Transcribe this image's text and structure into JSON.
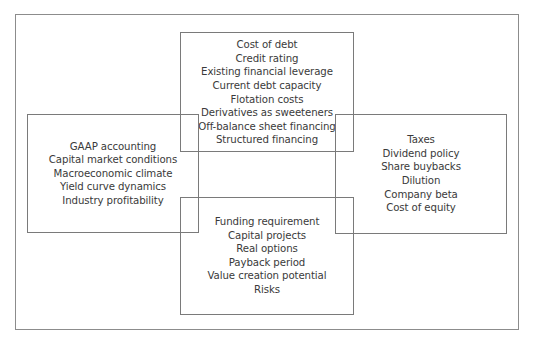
{
  "diagram": {
    "type": "overlapping-boxes",
    "boxes": {
      "top": {
        "items": [
          "Cost of debt",
          "Credit rating",
          "Existing financial leverage",
          "Current debt capacity",
          "Flotation costs",
          "Derivatives as sweeteners",
          "Off-balance sheet financing",
          "Structured financing"
        ]
      },
      "left": {
        "items": [
          "GAAP accounting",
          "Capital market conditions",
          "Macroeconomic climate",
          "Yield curve dynamics",
          "Industry profitability"
        ]
      },
      "right": {
        "items": [
          "Taxes",
          "Dividend policy",
          "Share buybacks",
          "Dilution",
          "Company beta",
          "Cost of equity"
        ]
      },
      "bottom": {
        "items": [
          "Funding requirement",
          "Capital projects",
          "Real options",
          "Payback period",
          "Value creation potential",
          "Risks"
        ]
      }
    },
    "colors": {
      "border": "#7a7a7a",
      "frame": "#8c8c8c",
      "text": "#3a3a3a",
      "background": "#ffffff"
    }
  }
}
